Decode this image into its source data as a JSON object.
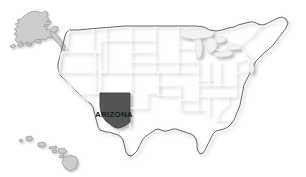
{
  "map": {
    "title": "United States map with Arizona highlighted",
    "highlighted_state": {
      "name": "Arizona",
      "label": "ARIZONA",
      "fill_color": "#555555",
      "label_color": "#1a1a1a"
    },
    "base_state_fill": "#cccccc",
    "base_state_border": "#ffffff",
    "outline_color": "#555555",
    "lake_fill": "#f2f2f2",
    "background_color": "#ffffff",
    "insets": [
      {
        "name": "Alaska",
        "position": "top-left"
      },
      {
        "name": "Hawaii",
        "position": "bottom-left"
      }
    ],
    "regions": [
      "Contiguous United States",
      "Alaska",
      "Hawaii"
    ]
  }
}
